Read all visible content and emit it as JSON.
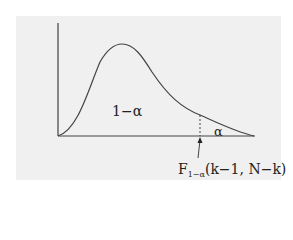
{
  "diagram": {
    "type": "F-distribution density curve with shaded critical region",
    "labels": {
      "body_area": "1−α",
      "tail_area": "α",
      "critical_value_main": "F",
      "critical_value_sub": "1−α",
      "critical_value_args": "(k−1, N−k)"
    },
    "colors": {
      "panel_background": "#f0f0f0",
      "curve": "#444444",
      "axis": "#444444",
      "page_background": "#ffffff"
    }
  }
}
